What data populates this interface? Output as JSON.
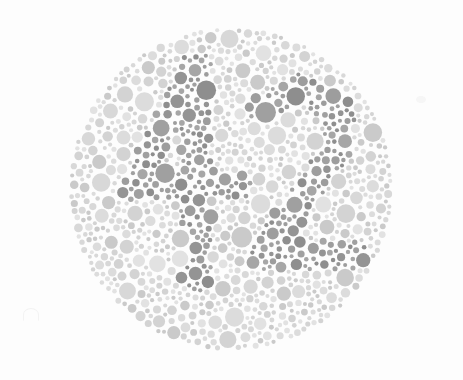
{
  "figure": {
    "title": "Ishihara color vision test plate",
    "hidden_numeral": "42",
    "description": "Circular pseudoisochromatic plate composed of many small dots of varying size; darker dots form the numeral against a field of lighter dots.",
    "frame": {
      "border_color": "#4a4a4a",
      "border_width_px": 1,
      "x": 15,
      "y": 12,
      "width": 437,
      "height": 359
    },
    "background_color": "#fdfdfd",
    "plate": {
      "center_x": 231,
      "center_y": 189,
      "radius": 162,
      "field_colors": [
        "#dcdcdc",
        "#d3d3d3",
        "#cacaca",
        "#e2e2e2",
        "#d8d8d8"
      ],
      "figure_colors": [
        "#9d9d9d",
        "#949494",
        "#a6a6a6",
        "#8e8e8e",
        "#a0a0a0"
      ],
      "dot_radius_min": 2.0,
      "dot_radius_max": 11.5,
      "dot_count_target": 1150
    },
    "artifacts": [
      {
        "name": "scan-smudge-lower-left",
        "x": 23,
        "y": 308
      },
      {
        "name": "scan-smudge-upper-right",
        "x": 416,
        "y": 96
      }
    ]
  },
  "chart_data": {
    "type": "scatter",
    "title": "Ishihara color vision test plate",
    "xlabel": "",
    "ylabel": "",
    "xlim": [
      69,
      393
    ],
    "ylim": [
      27,
      351
    ],
    "grid": false,
    "legend": null,
    "annotations": [
      "42"
    ],
    "series": [
      {
        "name": "background dots",
        "color": "#d6d6d6",
        "approx_count": 960
      },
      {
        "name": "numeral dots",
        "color": "#9a9a9a",
        "approx_count": 190
      }
    ],
    "numeral_strokes": {
      "digit_4": [
        {
          "from": [
            196,
            66
          ],
          "to": [
            136,
            186
          ]
        },
        {
          "from": [
            136,
            186
          ],
          "to": [
            236,
            186
          ]
        },
        {
          "from": [
            196,
            66
          ],
          "to": [
            196,
            276
          ]
        }
      ],
      "digit_2": [
        {
          "from": [
            264,
            110
          ],
          "to": [
            300,
            88
          ]
        },
        {
          "from": [
            300,
            88
          ],
          "to": [
            340,
            110
          ]
        },
        {
          "from": [
            340,
            110
          ],
          "to": [
            336,
            152
          ]
        },
        {
          "from": [
            336,
            152
          ],
          "to": [
            262,
            256
          ]
        },
        {
          "from": [
            262,
            256
          ],
          "to": [
            352,
            256
          ]
        }
      ]
    }
  }
}
